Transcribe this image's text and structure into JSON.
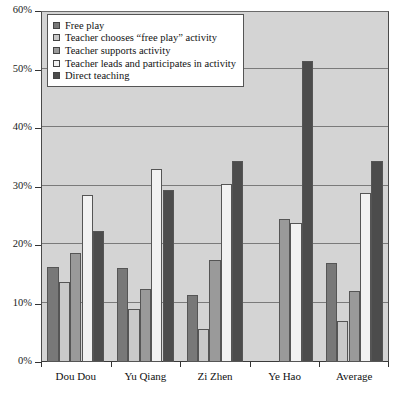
{
  "chart_data": {
    "type": "bar",
    "title": "",
    "xlabel": "",
    "ylabel": "",
    "ylim": [
      0,
      60
    ],
    "y_unit": "%",
    "grid": true,
    "grid_axis": "y",
    "legend_position": "top-left inside plot",
    "categories": [
      "Dou Dou",
      "Yu Qiang",
      "Zi Zhen",
      "Ye Hao",
      "Average"
    ],
    "y_ticks": [
      0,
      10,
      20,
      30,
      40,
      50,
      60
    ],
    "y_tick_labels": [
      "0%",
      "10%",
      "20%",
      "30%",
      "40%",
      "50%",
      "60%"
    ],
    "series": [
      {
        "name": "Free play",
        "color": "#787878",
        "values": [
          16.2,
          16.0,
          11.5,
          0,
          17.0
        ]
      },
      {
        "name": "Teacher chooses “free play” activity",
        "color": "#c9c9c9",
        "values": [
          13.7,
          9.0,
          5.6,
          0,
          7.0
        ]
      },
      {
        "name": "Teacher supports activity",
        "color": "#9a9a9a",
        "values": [
          18.7,
          12.5,
          17.4,
          24.4,
          12.1
        ]
      },
      {
        "name": "Teacher leads and participates in activity",
        "color": "#f2f2f2",
        "values": [
          28.6,
          33.0,
          30.5,
          23.8,
          28.9
        ]
      },
      {
        "name": "Direct teaching",
        "color": "#4c4c4c",
        "values": [
          22.4,
          29.4,
          34.4,
          51.4,
          34.4
        ]
      }
    ]
  },
  "legend": {
    "items": [
      {
        "label": "Free play",
        "swatch": "legend-swatch-free-play"
      },
      {
        "label": "Teacher chooses “free play” activity",
        "swatch": "legend-swatch-teacher-chooses"
      },
      {
        "label": "Teacher supports activity",
        "swatch": "legend-swatch-teacher-supports"
      },
      {
        "label": "Teacher leads and participates in activity",
        "swatch": "legend-swatch-teacher-leads"
      },
      {
        "label": "Direct teaching",
        "swatch": "legend-swatch-direct-teaching"
      }
    ]
  },
  "caption": {
    "text": ""
  },
  "colors": {
    "plot_background": "#d4d4d4",
    "gridline": "#7a7a7a",
    "axis": "#333333",
    "page_background": "#ffffff"
  }
}
